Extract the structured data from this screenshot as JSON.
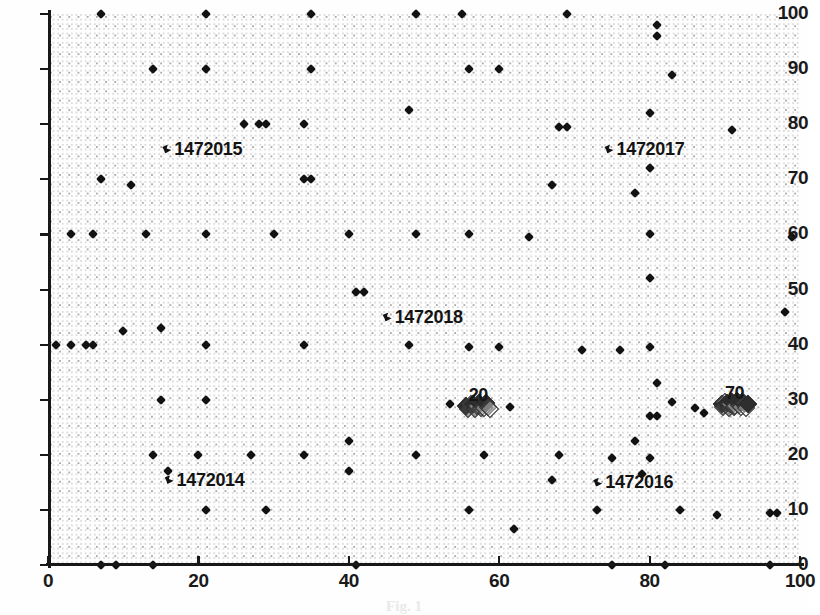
{
  "chart_data": {
    "type": "scatter",
    "title": "",
    "xlabel": "",
    "ylabel": "",
    "xlim": [
      0,
      100
    ],
    "ylim": [
      0,
      100
    ],
    "xticks": [
      0,
      20,
      40,
      60,
      80,
      100
    ],
    "yticks": [
      0,
      10,
      20,
      30,
      40,
      50,
      60,
      70,
      80,
      90,
      100
    ],
    "grid": "dotted",
    "legend": "none",
    "marker": "diamond",
    "marker_color": "#121212",
    "points": [
      [
        7,
        100
      ],
      [
        21,
        100
      ],
      [
        35,
        100
      ],
      [
        49,
        100
      ],
      [
        55,
        100
      ],
      [
        69,
        100
      ],
      [
        81,
        98
      ],
      [
        81,
        96
      ],
      [
        14,
        90
      ],
      [
        21,
        90
      ],
      [
        35,
        90
      ],
      [
        56,
        90
      ],
      [
        60,
        90
      ],
      [
        83,
        89
      ],
      [
        28,
        80
      ],
      [
        29,
        80
      ],
      [
        26,
        80
      ],
      [
        34,
        80
      ],
      [
        48,
        82.5
      ],
      [
        68,
        79.5
      ],
      [
        69,
        79.5
      ],
      [
        80,
        82
      ],
      [
        91,
        79
      ],
      [
        7,
        70
      ],
      [
        11,
        69
      ],
      [
        34,
        70
      ],
      [
        35,
        70
      ],
      [
        80,
        72
      ],
      [
        78,
        67.5
      ],
      [
        67,
        69
      ],
      [
        3,
        60
      ],
      [
        6,
        60
      ],
      [
        13,
        60
      ],
      [
        21,
        60
      ],
      [
        30,
        60
      ],
      [
        40,
        60
      ],
      [
        49,
        60
      ],
      [
        56,
        60
      ],
      [
        64,
        59.5
      ],
      [
        80,
        60
      ],
      [
        99,
        59.5
      ],
      [
        41,
        49.5
      ],
      [
        42,
        49.5
      ],
      [
        80,
        52
      ],
      [
        10,
        42.5
      ],
      [
        15,
        43
      ],
      [
        1,
        40
      ],
      [
        3,
        40
      ],
      [
        5,
        40
      ],
      [
        6,
        40
      ],
      [
        21,
        40
      ],
      [
        34,
        40
      ],
      [
        48,
        40
      ],
      [
        56,
        39.5
      ],
      [
        60,
        39.5
      ],
      [
        71,
        39
      ],
      [
        76,
        39
      ],
      [
        80,
        39.5
      ],
      [
        98,
        46
      ],
      [
        81,
        33
      ],
      [
        15,
        30
      ],
      [
        21,
        30
      ],
      [
        83,
        29.5
      ],
      [
        86,
        28.5
      ],
      [
        80,
        27
      ],
      [
        81,
        27
      ],
      [
        40,
        22.5
      ],
      [
        78,
        22.5
      ],
      [
        14,
        20
      ],
      [
        20,
        20
      ],
      [
        27,
        20
      ],
      [
        34,
        20
      ],
      [
        49,
        20
      ],
      [
        58,
        20
      ],
      [
        68,
        20
      ],
      [
        75,
        19.5
      ],
      [
        80,
        19.5
      ],
      [
        16,
        17
      ],
      [
        40,
        17
      ],
      [
        67,
        15.5
      ],
      [
        79,
        16.5
      ],
      [
        21,
        10
      ],
      [
        29,
        10
      ],
      [
        56,
        10
      ],
      [
        62,
        6.5
      ],
      [
        73,
        10
      ],
      [
        84,
        10
      ],
      [
        89,
        9
      ],
      [
        96,
        9.5
      ],
      [
        97,
        9.5
      ],
      [
        7,
        0
      ],
      [
        9,
        0
      ],
      [
        14,
        0
      ],
      [
        41,
        0
      ],
      [
        75,
        0
      ],
      [
        82,
        0
      ],
      [
        96,
        0
      ]
    ],
    "annotations": [
      {
        "label": "1472015",
        "x": 15.2,
        "y": 75.5
      },
      {
        "label": "1472017",
        "x": 74.0,
        "y": 75.5
      },
      {
        "label": "1472018",
        "x": 44.5,
        "y": 45.0
      },
      {
        "label": "1472014",
        "x": 15.5,
        "y": 15.5
      },
      {
        "label": "1472016",
        "x": 72.5,
        "y": 15.0
      }
    ],
    "clusters": [
      {
        "label": "20",
        "x": 57.2,
        "y": 29.2,
        "description": "dense overlapping diamond cluster of points",
        "members": 12,
        "flank_points": [
          [
            53.5,
            29.3
          ],
          [
            61.5,
            28.6
          ]
        ]
      },
      {
        "label": "70",
        "x": 91.3,
        "y": 29.5,
        "description": "dense overlapping diamond cluster of points",
        "members": 16,
        "flank_points": [
          [
            87.2,
            27.5
          ]
        ]
      }
    ]
  },
  "caption": {
    "text": "Fig. 1"
  }
}
